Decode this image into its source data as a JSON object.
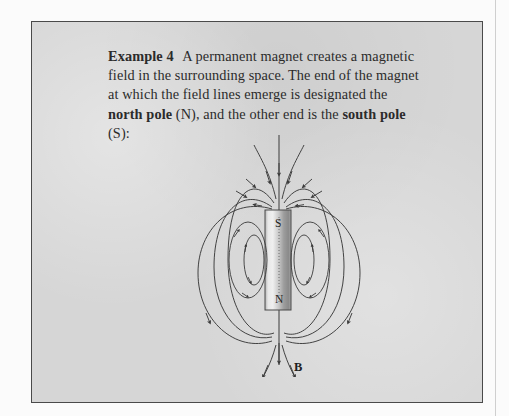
{
  "page": {
    "background_color": "#fbfbfb",
    "box_background_color": "#d6d6d6",
    "box_border_color": "#4a4a4a",
    "ink_color": "#2b2b2b"
  },
  "example": {
    "heading": "Example 4",
    "body_before_bold": "A permanent magnet creates a magnetic field in the surrounding space. The end of the magnet at which the field lines emerge is designated the ",
    "bold_term_1": "north pole",
    "body_middle": " (N), and the other end is the ",
    "bold_term_2": "south pole",
    "body_after": " (S):",
    "full_text": "Example 4  A permanent magnet creates a magnetic field in the surrounding space. The end of the magnet at which the field lines emerge is designated the north pole (N), and the other end is the south pole (S):"
  },
  "figure": {
    "name": "bar-magnet-field-line-diagram",
    "magnet": {
      "top_pole_label": "S",
      "bottom_pole_label": "N",
      "fill_light": "#eaeaea",
      "fill_mid": "#bdbdbd",
      "fill_dark": "#8f8f8f",
      "outline_color": "#4a4a4a"
    },
    "field_label": "B",
    "field_line_color": "#3a3a3a",
    "notes": {
      "flux_direction": "lines enter the S pole at the top and emerge from the N pole at the bottom",
      "outer_loop_count": 3,
      "inner_loop_count_per_side": 2,
      "axis_line": "vertical straight field line through the magnet axis with downward arrows"
    }
  }
}
